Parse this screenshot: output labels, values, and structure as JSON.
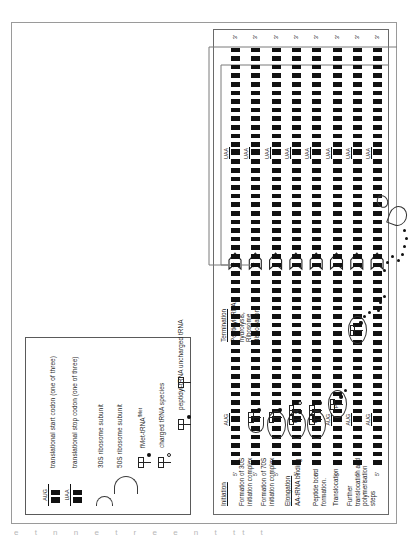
{
  "figure": {
    "kind": "protein-translation-diagram",
    "orientation_deg": -90
  },
  "legend": {
    "entries": [
      {
        "icon": "codon-aug",
        "code": "AUG",
        "label": "translational start codon (one of three)"
      },
      {
        "icon": "codon-uaa",
        "code": "UAA",
        "label": "translational stop codon (one of three)"
      },
      {
        "icon": "ribosome-30s-subunit",
        "code": "",
        "label": "30S ribosome subunit"
      },
      {
        "icon": "ribosome-50s-subunit",
        "code": "",
        "label": "50S ribosome subunit"
      },
      {
        "icon": "fmet-trna",
        "code": "",
        "label": "fMet-tRNA",
        "sup": "fMet"
      },
      {
        "icon": "charged-trna",
        "code": "",
        "label": "charged tRNA species"
      },
      {
        "icon": "peptidyl-trna",
        "code": "",
        "label": "peptidyl-tRNA"
      },
      {
        "icon": "uncharged-trna",
        "code": "",
        "label": "uncharged tRNA"
      }
    ]
  },
  "steps": [
    {
      "id": "initiation",
      "heading": "Initiation",
      "text": ""
    },
    {
      "id": "30s-complex",
      "heading": "",
      "text": "Formation of 30S\ninitiation complex"
    },
    {
      "id": "70s-complex",
      "heading": "",
      "text": "Formation of 70S\ninitiation complex"
    },
    {
      "id": "elongation",
      "heading": "Elongation",
      "text": "AA-tRNA binding"
    },
    {
      "id": "peptide-bond",
      "heading": "",
      "text": "Peptide bond\nformation."
    },
    {
      "id": "translocation",
      "heading": "",
      "text": "Translocation"
    },
    {
      "id": "further-steps",
      "heading": "",
      "text": "Further\ntranslocation and\npolymerisation\nsteps"
    },
    {
      "id": "termination",
      "heading": "Termination",
      "text": "Peptidyl-tRNA\nhydrolysis,\nRibosome\ndissociation"
    }
  ],
  "mrna": {
    "five_prime": "5'",
    "three_prime": "3'",
    "start_codon": "AUG",
    "stop_codon": "UAA"
  },
  "sites": {
    "p_site": "P",
    "a_site": "A",
    "e_site": "E"
  },
  "colors": {
    "ink": "#111111",
    "rule": "#6a6a6a",
    "paper": "#ffffff",
    "loop": "#777777"
  },
  "scan_artifact": {
    "bottom_strip": "e  t n n e t r  e e n t tt t"
  }
}
